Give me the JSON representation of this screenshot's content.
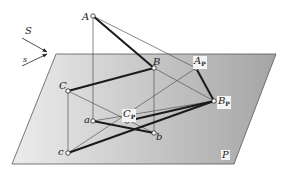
{
  "diagram": {
    "type": "parallel-projection",
    "colors": {
      "plane_light": "#e6e6e6",
      "plane_dark": "#a9a9a9",
      "plane_edge": "#555555",
      "thin_line": "#555555",
      "thick_line": "#1a1a1a"
    },
    "plane": {
      "label": "P",
      "corners": [
        [
          56,
          54
        ],
        [
          276,
          54
        ],
        [
          234,
          164
        ],
        [
          12,
          164
        ]
      ]
    },
    "direction": {
      "S_label": "S",
      "s_label": "s"
    },
    "points": {
      "A": {
        "label": "A",
        "sub": "",
        "x": 93,
        "y": 16
      },
      "B": {
        "label": "B",
        "sub": "",
        "x": 154,
        "y": 68
      },
      "C": {
        "label": "C",
        "sub": "",
        "x": 68,
        "y": 91
      },
      "a": {
        "label": "a",
        "sub": "",
        "x": 93,
        "y": 121
      },
      "b": {
        "label": "b",
        "sub": "",
        "x": 154,
        "y": 133
      },
      "c": {
        "label": "c",
        "sub": "",
        "x": 68,
        "y": 153
      },
      "Ap": {
        "label": "A",
        "sub": "P",
        "x": 196,
        "y": 68
      },
      "Bp": {
        "label": "B",
        "sub": "P",
        "x": 214,
        "y": 101
      },
      "Cp": {
        "label": "C",
        "sub": "P",
        "x": 127,
        "y": 121
      }
    }
  }
}
